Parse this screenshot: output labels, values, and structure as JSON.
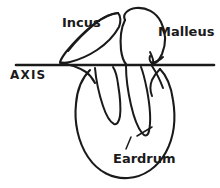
{
  "figure": {
    "type": "line-drawing",
    "background_color": "#ffffff",
    "ink_color": "#1a1a1a",
    "width": 220,
    "height": 188
  },
  "labels": {
    "incus": {
      "text": "Incus",
      "x": 62,
      "y": 27,
      "font_size": 13,
      "anchor": "start"
    },
    "malleus": {
      "text": "Malleus",
      "x": 158,
      "y": 36,
      "font_size": 13,
      "anchor": "start"
    },
    "axis": {
      "text": "AXIS",
      "x": 10,
      "y": 79,
      "font_size": 12,
      "anchor": "start",
      "letter_spacing": 1.2
    },
    "eardrum": {
      "text": "Eardrum",
      "x": 113,
      "y": 163,
      "font_size": 13,
      "anchor": "start"
    }
  },
  "axis_line": {
    "name": "axis-line",
    "x1": 16,
    "y1": 65,
    "x2": 214,
    "y2": 65,
    "stroke_width": 2.6
  },
  "shapes": {
    "incus_body": "M 118 13 C 110 14 102 18 94 24 C 84 32 74 42 66 52 C 63 56 61 59 60 62 C 62 63 66 63 70 62 C 78 60 88 56 97 50 C 106 44 114 36 119 27 C 121 22 121 16 118 13 Z",
    "incus_upper_edge": "M 118 13 C 112 13 104 17 96 23 C 86 31 76 41 68 51",
    "malleus_head": "M 125 20 C 122 14 128 9 136 8 C 146 7 156 12 161 22 C 166 32 166 44 162 54 C 159 61 155 64 152 63 C 150 62 149 59 150 56",
    "malleus_inner": "M 125 20 C 121 28 120 40 121 50 C 122 57 124 62 126 64",
    "malleus_tail": "M 152 63 C 156 62 160 60 163 57",
    "malleus_hook_upper": "M 150 52 C 152 56 154 60 153 63",
    "eardrum_outline": "M 90 70 C 82 78 77 90 76 104 C 74 122 78 142 88 157 C 98 172 113 179 128 178 C 144 177 158 167 166 152 C 174 137 176 118 173 100 C 171 86 166 75 160 69",
    "eardrum_left_shoulder": "M 60 63 C 68 64 78 67 86 72 C 90 75 93 79 95 83",
    "prong_left": "M 95 68 C 96 80 99 94 103 106 C 106 115 110 122 114 124 C 117 125 119 122 120 116 C 121 108 120 96 118 84 C 117 76 115 70 113 67",
    "prong_right": "M 126 66 C 126 78 128 92 131 105 C 134 118 138 128 142 133 C 145 137 148 136 149 131 C 151 122 150 106 147 90 C 145 80 143 72 141 67",
    "prong_right_outer": "M 152 66 C 156 72 160 80 163 88",
    "malleus_neck_right": "M 160 69 C 157 72 154 76 152 80 C 150 85 150 91 152 96",
    "leader_diagonal": "M 137 136 L 152 127",
    "leader_tick": "M 126 149 L 131 137"
  },
  "stroke_widths": {
    "outline": 2.1,
    "thin": 1.7,
    "leader": 1.5
  }
}
